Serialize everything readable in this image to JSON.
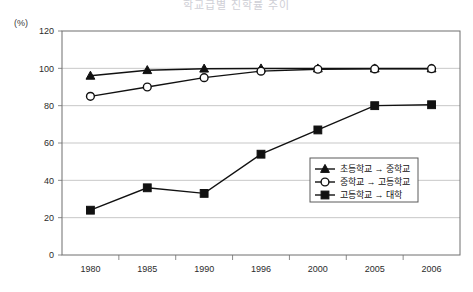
{
  "header": {
    "title_faint": "학교급별 진학률 추이",
    "unit_label": "(%)"
  },
  "chart_data": {
    "type": "line",
    "title": "",
    "xlabel": "",
    "ylabel": "",
    "unit": "(%)",
    "categories": [
      "1980",
      "1985",
      "1990",
      "1996",
      "2000",
      "2005",
      "2006"
    ],
    "ylim": [
      0,
      120
    ],
    "yticks": [
      0,
      20,
      40,
      60,
      80,
      100,
      120
    ],
    "ytick_labels": [
      "0",
      "20",
      "40",
      "60",
      "80",
      "100",
      "120"
    ],
    "grid": true,
    "grid_axis": "y",
    "legend_position": "center-right",
    "series": [
      {
        "name": "초등학교 → 중학교",
        "marker": "triangle-filled",
        "values": [
          96,
          99,
          99.8,
          99.9,
          99.9,
          99.9,
          99.9
        ]
      },
      {
        "name": "중학교 → 고등학교",
        "marker": "circle-open",
        "values": [
          85,
          90,
          95,
          98.5,
          99.5,
          99.7,
          99.8
        ]
      },
      {
        "name": "고등학교 → 대학",
        "marker": "square-filled",
        "values": [
          24,
          36,
          33,
          54,
          67,
          80,
          80.5
        ]
      }
    ]
  },
  "legend": {
    "entries": [
      {
        "label": "초등학교 → 중학교",
        "marker": "triangle-filled"
      },
      {
        "label": "중학교 → 고등학교",
        "marker": "circle-open"
      },
      {
        "label": "고등학교 → 대학",
        "marker": "square-filled"
      }
    ]
  },
  "colors": {
    "ink": "#111111",
    "axis": "#6f6f6f",
    "grid": "#b9b9b9",
    "background": "#ffffff"
  }
}
